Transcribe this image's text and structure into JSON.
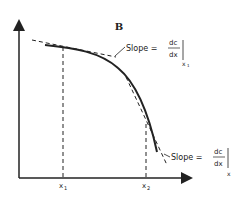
{
  "diagram": {
    "panel_label": "B",
    "curve": "concave-down decreasing curve",
    "tangent1": {
      "label_prefix": "Slope =",
      "numerator": "dc",
      "denominator": "dx",
      "subscript": "x",
      "subscript_index": "1"
    },
    "tangent2": {
      "label_prefix": "Slope =",
      "numerator": "dc",
      "denominator": "dx",
      "subscript": "x"
    },
    "x_ticks": [
      {
        "label": "x",
        "index": "1"
      },
      {
        "label": "x",
        "index": "2"
      }
    ],
    "colors": {
      "ink": "#222222",
      "background": "#ffffff"
    }
  }
}
